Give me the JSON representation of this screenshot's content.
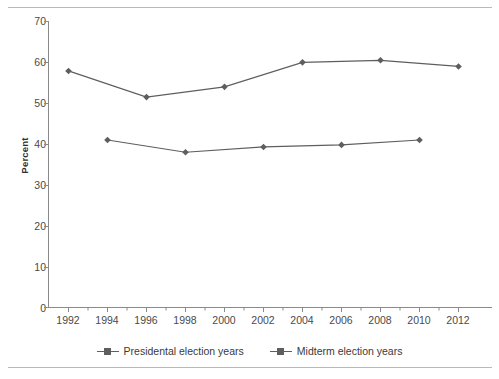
{
  "chart_data": {
    "type": "line",
    "title": "",
    "xlabel": "",
    "ylabel": "Percent",
    "ylim": [
      0,
      70
    ],
    "ytick_step": 10,
    "yticks": [
      "0",
      "10",
      "20",
      "30",
      "40",
      "50",
      "60",
      "70"
    ],
    "xlim": [
      1991,
      2013
    ],
    "xticks": [
      "1992",
      "1994",
      "1996",
      "1998",
      "2000",
      "2002",
      "2004",
      "2006",
      "2008",
      "2010",
      "2012"
    ],
    "grid": false,
    "legend_position": "bottom-center",
    "series": [
      {
        "name": "Presidental election years",
        "color": "#5e5e5e",
        "marker": "diamond",
        "x": [
          1992,
          1996,
          2000,
          2004,
          2008,
          2012
        ],
        "values": [
          57.9,
          51.5,
          54.0,
          60.0,
          60.5,
          59.0
        ]
      },
      {
        "name": "Midterm election years",
        "color": "#5e5e5e",
        "marker": "diamond",
        "x": [
          1994,
          1998,
          2002,
          2006,
          2010
        ],
        "values": [
          41.0,
          38.0,
          39.3,
          39.8,
          41.0
        ]
      }
    ]
  },
  "figure": {
    "axis_color": "#8a8a8a",
    "rule_color": "#b9b9b9",
    "background": "#ffffff"
  },
  "legend": {
    "items": [
      {
        "label": "Presidental election years"
      },
      {
        "label": "Midterm election years"
      }
    ]
  }
}
